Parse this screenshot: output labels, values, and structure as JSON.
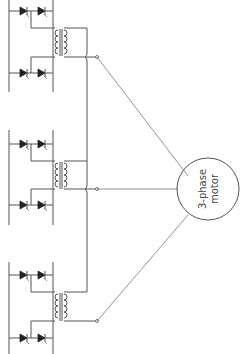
{
  "diagram": {
    "type": "circuit-schematic",
    "motor": {
      "label_line1": "3-phase",
      "label_line2": "motor",
      "center": [
        208,
        200
      ],
      "radius": 30
    },
    "phases": [
      {
        "name": "phase-a",
        "top_diode_y": 11,
        "bottom_diode_y": 73,
        "transformer_y": [
          28,
          56
        ],
        "output_node": [
          97,
          57
        ]
      },
      {
        "name": "phase-b",
        "top_diode_y": 144,
        "bottom_diode_y": 205,
        "transformer_y": [
          161,
          189
        ],
        "output_node": [
          97,
          189
        ]
      },
      {
        "name": "phase-c",
        "top_diode_y": 275,
        "bottom_diode_y": 338,
        "transformer_y": [
          292,
          321
        ],
        "output_node": [
          97,
          321
        ]
      }
    ],
    "colors": {
      "line": "#555555",
      "background": "#ffffff",
      "diode": "#222222"
    }
  }
}
